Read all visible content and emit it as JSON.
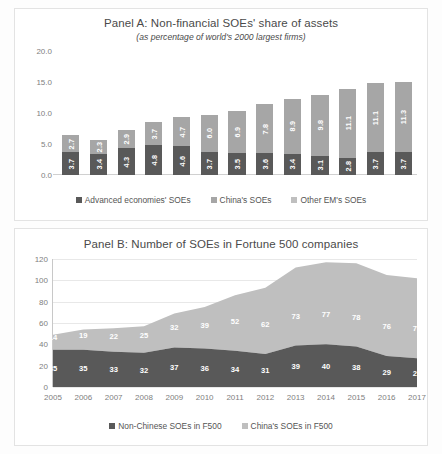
{
  "panelA": {
    "title": "Panel A: Non-financial SOEs' share of assets",
    "subtitle": "(as percentage of world's 2000 largest firms)",
    "legend": [
      {
        "label": "Advanced economies' SOEs",
        "color": "#595959"
      },
      {
        "label": "China's SOEs",
        "color": "#a6a6a6"
      },
      {
        "label": "Other EM's SOEs",
        "color": "#bfbfbf"
      }
    ]
  },
  "panelB": {
    "title": "Panel B: Number of SOEs in Fortune 500 companies",
    "legend": [
      {
        "label": "Non-Chinese SOEs in F500",
        "color": "#595959"
      },
      {
        "label": "China's SOEs in F500",
        "color": "#bfbfbf"
      }
    ]
  },
  "chart_data": [
    {
      "type": "bar",
      "title": "Panel A: Non-financial SOEs' share of assets",
      "subtitle": "(as percentage of world's 2000 largest firms)",
      "stacked": true,
      "xlabel": "",
      "ylabel": "",
      "ylim": [
        0.0,
        20.0
      ],
      "yticks": [
        "0.0",
        "5.0",
        "10.0",
        "15.0",
        "20.0"
      ],
      "ytick_values": [
        0.0,
        5.0,
        10.0,
        15.0,
        20.0
      ],
      "grid": false,
      "legend_position": "bottom",
      "categories": [
        "2005",
        "2006",
        "2007",
        "2008",
        "2009",
        "2010",
        "2011",
        "2012",
        "2013",
        "2014",
        "2015",
        "2016",
        "2017"
      ],
      "series": [
        {
          "name": "Advanced economies' SOEs",
          "color": "#595959",
          "values": [
            3.7,
            3.4,
            4.3,
            4.8,
            4.6,
            3.7,
            3.5,
            3.6,
            3.4,
            3.1,
            2.8,
            3.7,
            3.7
          ],
          "labels": [
            "3.7",
            "3.4",
            "4.3",
            "4.8",
            "4.6",
            "3.7",
            "3.5",
            "3.6",
            "3.4",
            "3.1",
            "2.8",
            "3.7",
            "3.7"
          ]
        },
        {
          "name": "China's SOEs + Other EM's SOEs",
          "color": "#a6a6a6",
          "values": [
            2.7,
            2.3,
            2.9,
            3.7,
            4.7,
            6.0,
            6.9,
            7.8,
            8.9,
            9.8,
            11.1,
            11.1,
            11.3
          ],
          "labels": [
            "2.7",
            "2.3",
            "2.9",
            "3.7",
            "4.7",
            "6.0",
            "6.9",
            "7.8",
            "8.9",
            "9.8",
            "11.1",
            "11.1",
            "11.3"
          ]
        }
      ],
      "totals": [
        7.3,
        6.4,
        7.9,
        9.3,
        10.5,
        11.1,
        12.0,
        13.3,
        14.3,
        14.6,
        15.6,
        16.7,
        16.9
      ]
    },
    {
      "type": "area",
      "title": "Panel B: Number of SOEs in Fortune 500 companies",
      "stacked": true,
      "xlabel": "",
      "ylabel": "",
      "ylim": [
        0,
        120
      ],
      "yticks": [
        "0",
        "20",
        "40",
        "60",
        "80",
        "100",
        "120"
      ],
      "ytick_values": [
        0,
        20,
        40,
        60,
        80,
        100,
        120
      ],
      "grid": true,
      "legend_position": "bottom",
      "x": [
        "2005",
        "2006",
        "2007",
        "2008",
        "2009",
        "2010",
        "2011",
        "2012",
        "2013",
        "2014",
        "2015",
        "2016",
        "2017"
      ],
      "series": [
        {
          "name": "Non-Chinese SOEs in F500",
          "color": "#595959",
          "values": [
            35,
            35,
            33,
            32,
            37,
            36,
            34,
            31,
            39,
            40,
            38,
            29,
            27
          ],
          "labels": [
            "35",
            "35",
            "33",
            "32",
            "37",
            "36",
            "34",
            "31",
            "39",
            "40",
            "38",
            "29",
            "27"
          ]
        },
        {
          "name": "China's SOEs in F500",
          "color": "#bfbfbf",
          "values": [
            14,
            19,
            22,
            25,
            32,
            39,
            52,
            62,
            73,
            77,
            78,
            76,
            75
          ],
          "labels": [
            "14",
            "19",
            "22",
            "25",
            "32",
            "39",
            "52",
            "62",
            "73",
            "77",
            "78",
            "76",
            "75"
          ]
        }
      ],
      "totals": [
        49,
        54,
        55,
        57,
        69,
        75,
        86,
        93,
        112,
        117,
        116,
        105,
        102
      ]
    }
  ]
}
